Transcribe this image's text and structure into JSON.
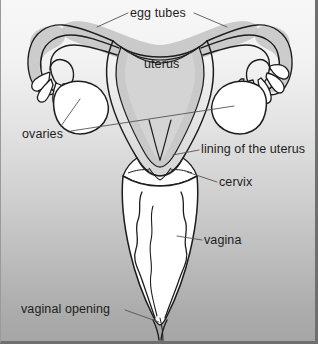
{
  "figure": {
    "style": "grayscale line drawing, cross-section, front view",
    "background": {
      "top_color": "#f7f7f7",
      "bottom_color": "#a6a6a6",
      "border_color": "#6f6f6f"
    },
    "colors": {
      "ink": "#1d1d1d",
      "organ_fill": "#ffffff",
      "cavity_shading": "#c9c9c9",
      "tube_shading": "#bdbdbd",
      "leader_line": "#4a4a4a"
    }
  },
  "labels": [
    {
      "id": "egg-tubes",
      "text": "egg tubes",
      "x": 129,
      "y": 7,
      "align": "left"
    },
    {
      "id": "uterus",
      "text": "uterus",
      "x": 143,
      "y": 58,
      "align": "left"
    },
    {
      "id": "ovaries",
      "text": "ovaries",
      "x": 21,
      "y": 128,
      "align": "left"
    },
    {
      "id": "lining-of-the-uterus",
      "text": "lining of the uterus",
      "x": 200,
      "y": 143,
      "align": "left"
    },
    {
      "id": "cervix",
      "text": "cervix",
      "x": 218,
      "y": 176,
      "align": "left"
    },
    {
      "id": "vagina",
      "text": "vagina",
      "x": 203,
      "y": 234,
      "align": "left"
    },
    {
      "id": "vaginal-opening",
      "text": "vaginal opening",
      "x": 20,
      "y": 303,
      "align": "left"
    }
  ],
  "parts": [
    {
      "id": "egg-tubes",
      "name": "egg tubes (fallopian tubes)"
    },
    {
      "id": "uterus",
      "name": "uterus"
    },
    {
      "id": "ovaries",
      "name": "ovaries"
    },
    {
      "id": "lining-of-the-uterus",
      "name": "lining of the uterus (endometrium)"
    },
    {
      "id": "cervix",
      "name": "cervix"
    },
    {
      "id": "vagina",
      "name": "vagina"
    },
    {
      "id": "vaginal-opening",
      "name": "vaginal opening"
    }
  ]
}
